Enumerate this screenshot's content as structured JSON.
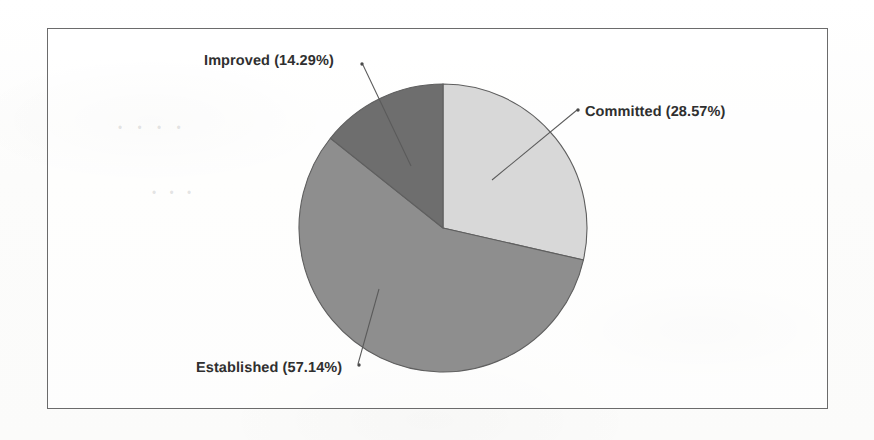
{
  "figure": {
    "background_color": "#fdfdfc",
    "border_color": "#6b6b6b",
    "label_color": "#2f2f2f",
    "leader_line_color": "#5a5a5a"
  },
  "ghost_artifacts": {
    "mark_1": "• • • •",
    "mark_2": "• • •"
  },
  "chart_data": {
    "type": "pie",
    "title": "",
    "subtitle": "",
    "xlabel": "",
    "ylabel": "",
    "grid": false,
    "legend_position": "none",
    "labels_outside": true,
    "start_angle_deg": 0,
    "direction": "clockwise",
    "categories": [
      "Committed",
      "Established",
      "Improved"
    ],
    "values": [
      28.57,
      57.14,
      14.29
    ],
    "units": "percent",
    "slices": [
      {
        "name": "Committed",
        "value": 28.57,
        "label": "Committed (28.57%)",
        "color": "#d8d8d8",
        "start_angle_deg": 0,
        "end_angle_deg": 102.85
      },
      {
        "name": "Established",
        "value": 57.14,
        "label": "Established (57.14%)",
        "color": "#8e8e8e",
        "start_angle_deg": 102.85,
        "end_angle_deg": 308.5
      },
      {
        "name": "Improved",
        "value": 14.29,
        "label": "Improved (14.29%)",
        "color": "#6e6e6e",
        "start_angle_deg": 308.5,
        "end_angle_deg": 360
      }
    ]
  }
}
